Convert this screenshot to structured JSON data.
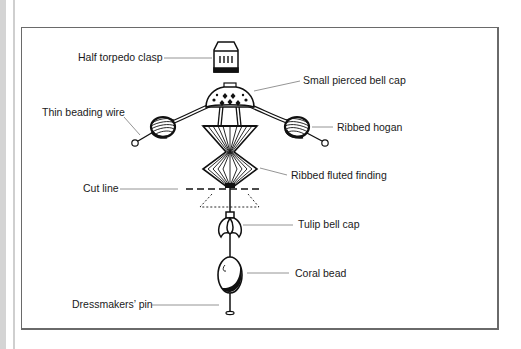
{
  "diagram": {
    "labels": {
      "half_torpedo_clasp": "Half torpedo clasp",
      "small_pierced_bell_cap": "Small pierced bell cap",
      "thin_beading_wire": "Thin beading wire",
      "ribbed_hogan": "Ribbed hogan",
      "ribbed_fluted_finding": "Ribbed fluted finding",
      "cut_line": "Cut line",
      "tulip_bell_cap": "Tulip bell cap",
      "coral_bead": "Coral bead",
      "dressmakers_pin": "Dressmakers’ pin"
    },
    "colors": {
      "ink": "#111111",
      "leader": "#7a7a7a",
      "frame": "#6a6a6a",
      "side_bar": "#d4d4d4"
    }
  }
}
